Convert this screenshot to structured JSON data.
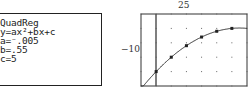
{
  "calculator_screen": {
    "lines": [
      "QuadReg",
      "y=ax²+bx+c",
      "a=⁻.005",
      "b=.55",
      "c=5"
    ]
  },
  "graph": {
    "ymax_label": "25",
    "xmin_label": "−10"
  },
  "chart_data": {
    "type": "scatter",
    "title": "",
    "xlabel": "",
    "ylabel": "",
    "window": {
      "xmin": -10,
      "xmax": 60,
      "ymin": 0,
      "ymax": 25
    },
    "tick_labels": {
      "top": "25",
      "left": "−10"
    },
    "grid": true,
    "series": [
      {
        "name": "data points",
        "x": [
          0,
          10,
          20,
          30,
          40,
          50
        ],
        "y": [
          5,
          10,
          14,
          17,
          19,
          20
        ]
      },
      {
        "name": "regression curve",
        "equation": "y = -0.005x^2 + 0.55x + 5"
      }
    ]
  }
}
